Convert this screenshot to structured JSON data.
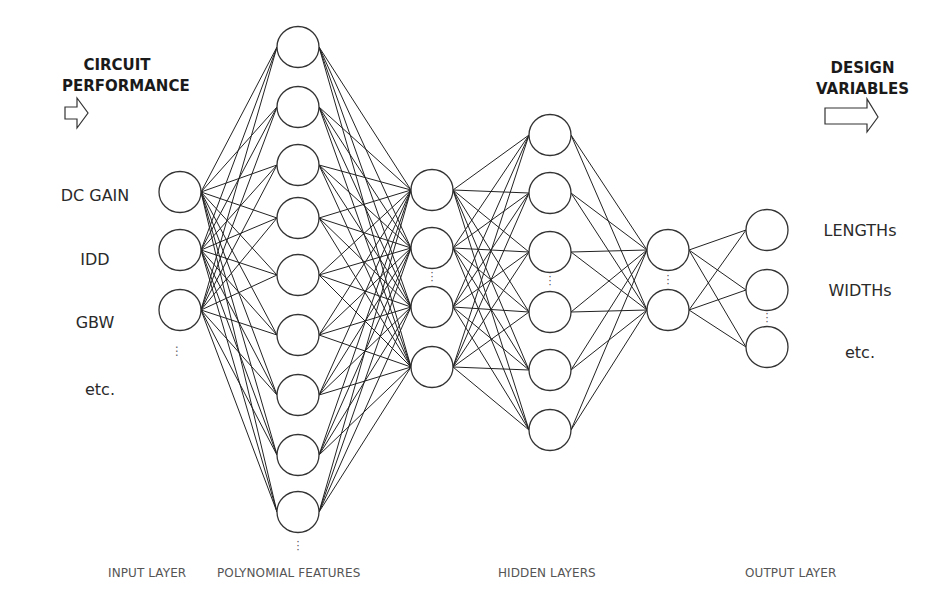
{
  "headings": {
    "left": {
      "line1": "CIRCUIT",
      "line2": "PERFORMANCE"
    },
    "right": {
      "line1": "DESIGN",
      "line2": "VARIABLES"
    }
  },
  "inputs": {
    "items": [
      "DC GAIN",
      "IDD",
      "GBW"
    ],
    "ellipsis": "⋮",
    "more": "etc."
  },
  "outputs": {
    "items": [
      "LENGTHs",
      "WIDTHs"
    ],
    "more": "etc."
  },
  "layer_labels": {
    "input": "INPUT LAYER",
    "polynomial": "POLYNOMIAL FEATURES",
    "hidden": "HIDDEN LAYERS",
    "output": "OUTPUT LAYER"
  },
  "colors": {
    "line": "#222222",
    "node_stroke": "#333333",
    "text": "#333333",
    "background": "#ffffff"
  },
  "network": {
    "node_radius": 21,
    "layers": [
      {
        "name": "input",
        "x": 180,
        "ys": [
          192,
          250,
          310
        ]
      },
      {
        "name": "polynomial",
        "x": 298,
        "ys": [
          47,
          107,
          165,
          218,
          275,
          335,
          395,
          455,
          512
        ]
      },
      {
        "name": "hidden1",
        "x": 432,
        "ys": [
          190,
          248,
          307,
          367
        ]
      },
      {
        "name": "hidden2",
        "x": 550,
        "ys": [
          135,
          193,
          252,
          312,
          370,
          430
        ]
      },
      {
        "name": "hidden3",
        "x": 668,
        "ys": [
          250,
          310
        ]
      },
      {
        "name": "output",
        "x": 767,
        "ys": [
          230,
          290,
          347
        ]
      }
    ]
  }
}
